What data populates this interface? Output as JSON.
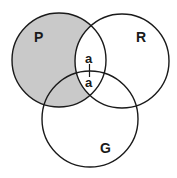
{
  "diagram": {
    "type": "venn",
    "colors": {
      "shade": "#c9c9c9",
      "stroke": "#1a1a1a",
      "background": "#ffffff"
    },
    "circles": [
      {
        "label": "P",
        "cx": 59,
        "cy": 60,
        "r": 47
      },
      {
        "label": "R",
        "cx": 122,
        "cy": 61,
        "r": 47
      },
      {
        "label": "G",
        "cx": 90,
        "cy": 119,
        "r": 48
      }
    ],
    "shaded_region": "P minus R",
    "marks": [
      {
        "label": "a",
        "position": "P∩R outside G"
      },
      {
        "label": "a",
        "position": "P∩R∩G"
      }
    ],
    "labels": {
      "p": "P",
      "r": "R",
      "g": "G",
      "a_top": "a",
      "a_bottom": "a"
    }
  }
}
